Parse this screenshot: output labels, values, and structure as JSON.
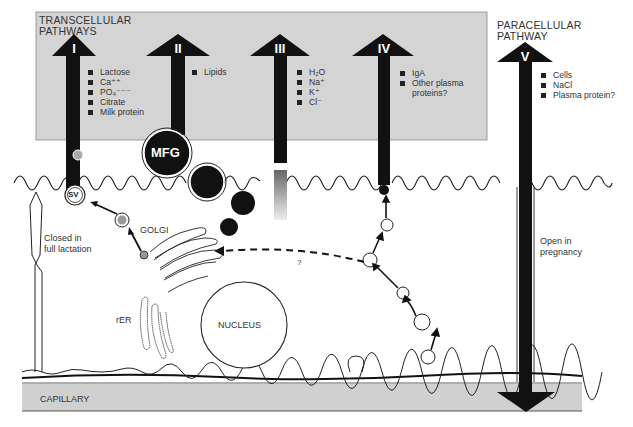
{
  "transcellular": {
    "title_line1": "TRANSCELLULAR",
    "title_line2": "PATHWAYS",
    "pathways": [
      {
        "numeral": "I",
        "items": [
          "Lactose",
          "Ca⁺⁺",
          "PO₄⁻⁻⁻",
          "Citrate",
          "Milk protein"
        ]
      },
      {
        "numeral": "II",
        "items": [
          "Lipids"
        ]
      },
      {
        "numeral": "III",
        "items": [
          "H₂O",
          "Na⁺",
          "K⁺",
          "Cl⁻"
        ]
      },
      {
        "numeral": "IV",
        "items": [
          "IgA",
          "Other plasma",
          "proteins?"
        ]
      }
    ]
  },
  "paracellular": {
    "title_line1": "PARACELLULAR",
    "title_line2": "PATHWAY",
    "numeral": "V",
    "items": [
      "Cells",
      "NaCl",
      "Plasma protein?"
    ]
  },
  "labels": {
    "mfg": "MFG",
    "sv": "SV",
    "golgi": "GOLGI",
    "nucleus": "NUCLEUS",
    "rer": "rER",
    "question": "?",
    "closed_line1": "Closed in",
    "closed_line2": "full lactation",
    "open_line1": "Open in",
    "open_line2": "pregnancy",
    "capillary": "CAPILLARY"
  },
  "colors": {
    "panel_gray": "#d4d4d4",
    "capillary_gray": "#d0d0d0",
    "arrow_black": "#111111",
    "line": "#222222"
  }
}
